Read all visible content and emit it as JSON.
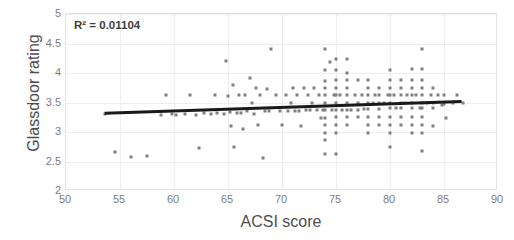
{
  "chart_data": {
    "type": "scatter",
    "title": "",
    "xlabel": "ACSI score",
    "ylabel": "Glassdoor rating",
    "xlim": [
      50,
      90
    ],
    "ylim": [
      2,
      5
    ],
    "xticks": [
      50,
      55,
      60,
      65,
      70,
      75,
      80,
      85,
      90
    ],
    "yticks": [
      2,
      2.5,
      3,
      3.5,
      4,
      4.5,
      5
    ],
    "grid": true,
    "legend": null,
    "annotations": [
      {
        "name": "r-squared",
        "text": "R² = 0.01104",
        "x": 51.0,
        "y": 4.88
      }
    ],
    "point_color": "#808080",
    "trendline": {
      "type": "linear",
      "color": "#1a1a1a",
      "x_start": 53.6,
      "y_start": 3.3,
      "x_end": 86.8,
      "y_end": 3.5,
      "r_squared": 0.01104
    },
    "points": [
      [
        53.6,
        3.31
      ],
      [
        54.5,
        2.66
      ],
      [
        56.0,
        2.57
      ],
      [
        57.5,
        2.6
      ],
      [
        58.8,
        3.29
      ],
      [
        59.3,
        3.62
      ],
      [
        59.8,
        3.3
      ],
      [
        60.2,
        3.28
      ],
      [
        61.0,
        3.3
      ],
      [
        61.5,
        3.62
      ],
      [
        62.0,
        3.29
      ],
      [
        62.3,
        2.73
      ],
      [
        62.8,
        3.33
      ],
      [
        63.4,
        3.3
      ],
      [
        63.8,
        3.63
      ],
      [
        64.0,
        3.33
      ],
      [
        64.6,
        3.3
      ],
      [
        64.8,
        4.2
      ],
      [
        65.0,
        3.61
      ],
      [
        65.2,
        3.34
      ],
      [
        65.3,
        3.1
      ],
      [
        65.5,
        3.8
      ],
      [
        65.6,
        2.74
      ],
      [
        65.8,
        3.33
      ],
      [
        66.0,
        3.62
      ],
      [
        66.2,
        3.33
      ],
      [
        66.4,
        3.05
      ],
      [
        66.6,
        3.62
      ],
      [
        66.8,
        3.35
      ],
      [
        67.0,
        3.92
      ],
      [
        67.2,
        3.5
      ],
      [
        67.4,
        3.3
      ],
      [
        67.6,
        3.74
      ],
      [
        67.8,
        3.12
      ],
      [
        68.0,
        3.62
      ],
      [
        68.2,
        2.56
      ],
      [
        68.4,
        3.35
      ],
      [
        68.6,
        3.73
      ],
      [
        68.8,
        3.35
      ],
      [
        69.0,
        4.4
      ],
      [
        69.4,
        3.62
      ],
      [
        69.8,
        3.35
      ],
      [
        70.0,
        3.12
      ],
      [
        70.4,
        3.62
      ],
      [
        70.6,
        3.36
      ],
      [
        70.8,
        3.5
      ],
      [
        71.0,
        3.74
      ],
      [
        71.2,
        3.36
      ],
      [
        71.4,
        3.62
      ],
      [
        71.6,
        3.36
      ],
      [
        71.8,
        3.1
      ],
      [
        72.0,
        3.74
      ],
      [
        72.2,
        3.37
      ],
      [
        72.4,
        3.62
      ],
      [
        72.6,
        3.37
      ],
      [
        72.8,
        3.5
      ],
      [
        73.0,
        3.75
      ],
      [
        73.2,
        3.37
      ],
      [
        73.4,
        3.62
      ],
      [
        73.6,
        3.23
      ],
      [
        73.8,
        3.37
      ],
      [
        74.0,
        4.4
      ],
      [
        74.0,
        4.05
      ],
      [
        74.0,
        3.87
      ],
      [
        74.0,
        3.75
      ],
      [
        74.0,
        3.62
      ],
      [
        74.0,
        3.5
      ],
      [
        74.0,
        3.37
      ],
      [
        74.0,
        3.24
      ],
      [
        74.0,
        3.12
      ],
      [
        74.0,
        2.99
      ],
      [
        74.0,
        2.86
      ],
      [
        74.0,
        2.62
      ],
      [
        74.4,
        4.18
      ],
      [
        74.6,
        3.38
      ],
      [
        74.8,
        3.62
      ],
      [
        75.0,
        4.24
      ],
      [
        75.0,
        4.05
      ],
      [
        75.0,
        3.88
      ],
      [
        75.0,
        3.75
      ],
      [
        75.0,
        3.62
      ],
      [
        75.0,
        3.5
      ],
      [
        75.0,
        3.38
      ],
      [
        75.0,
        3.25
      ],
      [
        75.0,
        3.12
      ],
      [
        75.0,
        2.98
      ],
      [
        75.0,
        2.62
      ],
      [
        75.4,
        3.62
      ],
      [
        75.6,
        3.38
      ],
      [
        76.0,
        4.24
      ],
      [
        76.0,
        4.0
      ],
      [
        76.0,
        3.88
      ],
      [
        76.0,
        3.75
      ],
      [
        76.0,
        3.62
      ],
      [
        76.0,
        3.5
      ],
      [
        76.0,
        3.38
      ],
      [
        76.0,
        3.25
      ],
      [
        76.0,
        3.12
      ],
      [
        76.4,
        3.38
      ],
      [
        76.8,
        3.62
      ],
      [
        77.0,
        3.88
      ],
      [
        77.0,
        3.5
      ],
      [
        77.0,
        3.38
      ],
      [
        77.0,
        3.25
      ],
      [
        77.4,
        3.62
      ],
      [
        77.6,
        3.39
      ],
      [
        78.0,
        3.88
      ],
      [
        78.0,
        3.75
      ],
      [
        78.0,
        3.62
      ],
      [
        78.0,
        3.5
      ],
      [
        78.0,
        3.39
      ],
      [
        78.0,
        3.26
      ],
      [
        78.0,
        3.12
      ],
      [
        78.0,
        2.98
      ],
      [
        78.4,
        3.5
      ],
      [
        78.6,
        3.62
      ],
      [
        79.0,
        3.75
      ],
      [
        79.0,
        3.62
      ],
      [
        79.0,
        3.5
      ],
      [
        79.0,
        3.39
      ],
      [
        79.0,
        3.26
      ],
      [
        79.0,
        3.12
      ],
      [
        79.4,
        3.5
      ],
      [
        79.8,
        3.62
      ],
      [
        80.0,
        4.05
      ],
      [
        80.0,
        3.88
      ],
      [
        80.0,
        3.75
      ],
      [
        80.0,
        3.62
      ],
      [
        80.0,
        3.5
      ],
      [
        80.0,
        3.4
      ],
      [
        80.0,
        3.26
      ],
      [
        80.0,
        3.12
      ],
      [
        80.0,
        2.98
      ],
      [
        80.0,
        2.74
      ],
      [
        80.4,
        3.62
      ],
      [
        80.6,
        3.4
      ],
      [
        81.0,
        3.88
      ],
      [
        81.0,
        3.75
      ],
      [
        81.0,
        3.62
      ],
      [
        81.0,
        3.5
      ],
      [
        81.0,
        3.4
      ],
      [
        81.0,
        3.26
      ],
      [
        81.0,
        3.12
      ],
      [
        81.4,
        3.5
      ],
      [
        81.6,
        3.62
      ],
      [
        82.0,
        4.06
      ],
      [
        82.0,
        3.88
      ],
      [
        82.0,
        3.75
      ],
      [
        82.0,
        3.62
      ],
      [
        82.0,
        3.5
      ],
      [
        82.0,
        3.41
      ],
      [
        82.0,
        3.26
      ],
      [
        82.0,
        3.12
      ],
      [
        82.0,
        2.98
      ],
      [
        82.4,
        3.62
      ],
      [
        82.8,
        3.41
      ],
      [
        83.0,
        4.4
      ],
      [
        83.0,
        4.06
      ],
      [
        83.0,
        3.88
      ],
      [
        83.0,
        3.75
      ],
      [
        83.0,
        3.62
      ],
      [
        83.0,
        3.5
      ],
      [
        83.0,
        3.41
      ],
      [
        83.0,
        3.26
      ],
      [
        83.0,
        3.12
      ],
      [
        83.0,
        2.98
      ],
      [
        83.0,
        2.68
      ],
      [
        83.4,
        3.5
      ],
      [
        83.8,
        3.62
      ],
      [
        84.0,
        3.75
      ],
      [
        84.0,
        3.5
      ],
      [
        84.0,
        3.41
      ],
      [
        84.0,
        3.1
      ],
      [
        84.4,
        3.62
      ],
      [
        84.8,
        3.46
      ],
      [
        85.0,
        3.62
      ],
      [
        85.0,
        3.48
      ],
      [
        85.2,
        3.24
      ],
      [
        85.8,
        3.5
      ],
      [
        86.2,
        3.62
      ],
      [
        86.8,
        3.5
      ]
    ]
  }
}
